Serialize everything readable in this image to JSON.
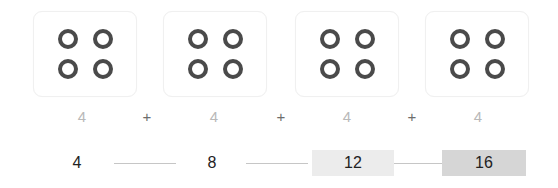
{
  "diagram": {
    "type": "repeated-addition-skip-counting",
    "title": "",
    "groups": [
      {
        "dots": 4,
        "label": "4"
      },
      {
        "dots": 4,
        "label": "4"
      },
      {
        "dots": 4,
        "label": "4"
      },
      {
        "dots": 4,
        "label": "4"
      }
    ],
    "operators": [
      "+",
      "+",
      "+"
    ],
    "running_totals": [
      {
        "value": "4",
        "highlight": "none",
        "bg": "#ffffff"
      },
      {
        "value": "8",
        "highlight": "none",
        "bg": "#ffffff"
      },
      {
        "value": "12",
        "highlight": "light",
        "bg": "#ececec"
      },
      {
        "value": "16",
        "highlight": "dark",
        "bg": "#d6d6d6"
      }
    ],
    "colors": {
      "ring_stroke": "#4a4a4a",
      "card_bg": "#ffffff",
      "card_border": "#f0f0f0",
      "addend_text": "#b9b9b9",
      "operator_text": "#6d6d6d",
      "total_text": "#222222",
      "connector_line": "#c6c6c6",
      "page_bg": "#ffffff"
    }
  }
}
